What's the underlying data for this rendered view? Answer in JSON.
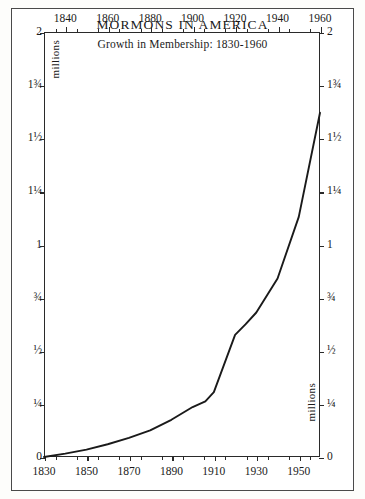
{
  "chart_data": {
    "type": "line",
    "title": "MORMONS IN AMERICA",
    "subtitle": "Growth in Membership: 1830-1960",
    "xlabel": "",
    "ylabel": "millions",
    "unit_label": "millions",
    "xlim": [
      1830,
      1960
    ],
    "ylim": [
      0,
      2
    ],
    "grid": false,
    "legend": null,
    "x_ticks_top": [
      "1840",
      "1860",
      "1880",
      "1900",
      "1920",
      "1940",
      "1960"
    ],
    "x_tick_top_values": [
      1840,
      1860,
      1880,
      1900,
      1920,
      1940,
      1960
    ],
    "x_ticks_bottom": [
      "1830",
      "1850",
      "1870",
      "1890",
      "1910",
      "1930",
      "1950"
    ],
    "x_tick_bottom_values": [
      1830,
      1850,
      1870,
      1890,
      1910,
      1930,
      1950
    ],
    "x_minor_tick_values": [
      1835,
      1845,
      1855,
      1865,
      1875,
      1885,
      1895,
      1905,
      1915,
      1925,
      1935,
      1945,
      1955
    ],
    "y_ticks_left": [
      "2",
      "1¾",
      "1½",
      "1¼",
      "1",
      "¾",
      "½",
      "¼",
      "0"
    ],
    "y_ticks_right": [
      "2",
      "1¾",
      "1½",
      "1¼",
      "1",
      "¾",
      "½",
      "¼",
      "0"
    ],
    "y_tick_values": [
      2,
      1.75,
      1.5,
      1.25,
      1,
      0.75,
      0.5,
      0.25,
      0
    ],
    "x": [
      1830,
      1840,
      1850,
      1860,
      1870,
      1880,
      1890,
      1900,
      1906,
      1910,
      1920,
      1925,
      1930,
      1940,
      1950,
      1960
    ],
    "values": [
      0.0,
      0.016,
      0.035,
      0.06,
      0.09,
      0.125,
      0.175,
      0.235,
      0.262,
      0.305,
      0.575,
      0.625,
      0.68,
      0.84,
      1.13,
      1.62
    ],
    "series": [
      {
        "name": "Membership (millions)",
        "values": [
          0.0,
          0.016,
          0.035,
          0.06,
          0.09,
          0.125,
          0.175,
          0.235,
          0.262,
          0.305,
          0.575,
          0.625,
          0.68,
          0.84,
          1.13,
          1.62
        ]
      }
    ],
    "line_color": "#1a1a1a",
    "background_color": "#ffffff",
    "border_color": "#4a4a4a"
  }
}
